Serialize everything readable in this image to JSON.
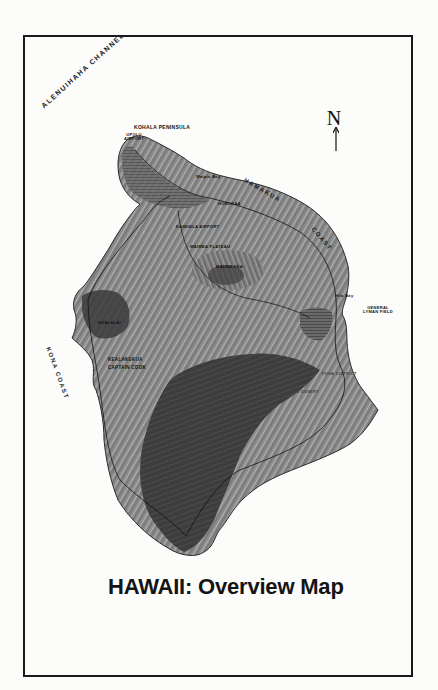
{
  "map": {
    "title": "HAWAII:  Overview Map",
    "north_indicator": "N",
    "water_labels": {
      "channel": "ALENUIHAHA CHANNEL",
      "hamakua": "HAMAKUA",
      "coast_ne": "COAST",
      "kona_coast": "KONA COAST"
    },
    "place_labels": {
      "kohala_peninsula": "KOHALA PENINSULA",
      "upolu_airport": "UPOLU AIRPORT",
      "waipio_bay": "Waipio Bay",
      "honokaa": "HONOKAA",
      "kamuela_airport": "KAMUELA AIRPORT",
      "waimea_plateau": "WAIMEA PLATEAU",
      "mauna_kea": "MAUNA KEA",
      "hilo_bay": "Hilo Bay",
      "general_lyman_field": "GENERAL LYMAN FIELD",
      "hualalai": "HUALALAI",
      "kealakekua": "KEALAKEKUA",
      "captain_cook": "CAPTAIN COOK",
      "puna_district": "PUNA DISTRICT",
      "kau_desert": "KAU DESERT"
    },
    "colors": {
      "frame": "#1a1a1a",
      "land_light": "#9a9a9a",
      "land_mid": "#6e6e6e",
      "land_dark": "#3a3a3a",
      "paper": "#fcfcfb"
    }
  }
}
